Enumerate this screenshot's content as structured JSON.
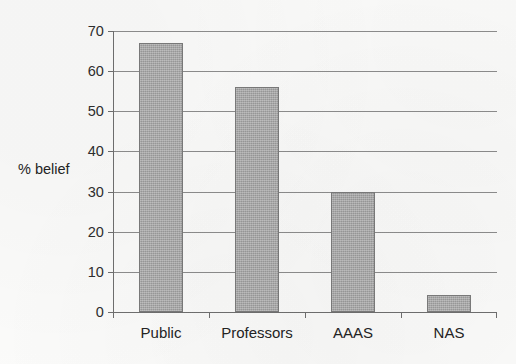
{
  "chart_data": {
    "type": "bar",
    "title": "",
    "subtitle": "",
    "xlabel": "",
    "ylabel": "% belief",
    "categories": [
      "Public",
      "Professors",
      "AAAS",
      "NAS"
    ],
    "values": [
      67,
      56,
      30,
      4.3
    ],
    "series": [
      {
        "name": "% belief",
        "values": [
          67,
          56,
          30,
          4.3
        ]
      }
    ],
    "ylim": [
      0,
      70
    ],
    "yticks": [
      0,
      10,
      20,
      30,
      40,
      50,
      60,
      70
    ],
    "ytick_labels": [
      "0",
      "10",
      "20",
      "30",
      "40",
      "50",
      "60",
      "70"
    ],
    "grid": "horizontal",
    "legend": "none",
    "bar_fill_color": "#a9a9a9",
    "bar_border_color": "#7b7b7b",
    "gridline_color": "#8d8d8d",
    "axis_color": "#6f6f6f",
    "background_color": "#fbfbfa",
    "text_color": "#242424"
  }
}
